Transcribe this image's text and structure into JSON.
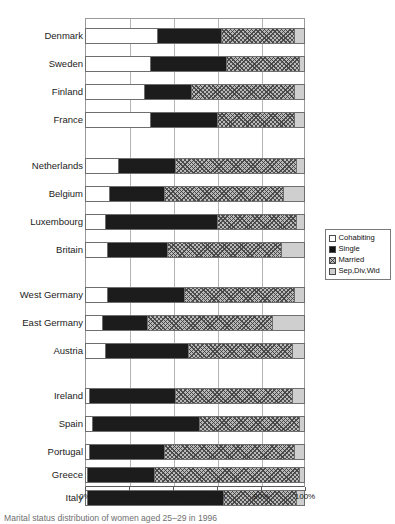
{
  "chart_data": {
    "type": "bar",
    "orientation": "horizontal",
    "stacked": true,
    "normalized": true,
    "title": "",
    "xlabel": "",
    "ylabel": "",
    "xlim": [
      0,
      100
    ],
    "xticks": [
      "0%",
      "20%",
      "40%",
      "60%",
      "80%",
      "100%"
    ],
    "xtick_values": [
      0,
      20,
      40,
      60,
      80,
      100
    ],
    "grid": true,
    "legend_position": "right",
    "categories": [
      "Denmark",
      "Sweden",
      "Finland",
      "France",
      "Netherlands",
      "Belgium",
      "Luxembourg",
      "Britain",
      "West Germany",
      "East Germany",
      "Austria",
      "Ireland",
      "Spain",
      "Portugal",
      "Greece",
      "Italy"
    ],
    "series": [
      {
        "name": "Cohabiting",
        "color": "#ffffff",
        "values": [
          33,
          30,
          27,
          30,
          15,
          11,
          9,
          10,
          10,
          8,
          9,
          2,
          3,
          2,
          1,
          1
        ]
      },
      {
        "name": "Single",
        "color": "#1c1c1c",
        "values": [
          29,
          34,
          21,
          30,
          26,
          25,
          51,
          27,
          35,
          20,
          38,
          39,
          49,
          34,
          30,
          62
        ]
      },
      {
        "name": "Married",
        "color": "#b9b9b9",
        "values": [
          34,
          34,
          48,
          36,
          56,
          55,
          37,
          53,
          51,
          58,
          48,
          54,
          46,
          60,
          67,
          34
        ]
      },
      {
        "name": "Sep,Div,Wid",
        "color": "#cfcfcf",
        "values": [
          4,
          2,
          4,
          4,
          3,
          9,
          3,
          10,
          4,
          14,
          5,
          5,
          2,
          4,
          2,
          3
        ]
      }
    ],
    "groups": [
      {
        "name": "nordic-france",
        "members": [
          "Denmark",
          "Sweden",
          "Finland",
          "France"
        ]
      },
      {
        "name": "benelux-britain",
        "members": [
          "Netherlands",
          "Belgium",
          "Luxembourg",
          "Britain"
        ]
      },
      {
        "name": "germanic",
        "members": [
          "West Germany",
          "East Germany",
          "Austria"
        ]
      },
      {
        "name": "southern",
        "members": [
          "Ireland",
          "Spain",
          "Portugal",
          "Greece",
          "Italy"
        ]
      }
    ]
  },
  "legend": {
    "items": [
      {
        "label": "Cohabiting",
        "swatch": "cohabiting"
      },
      {
        "label": "Single",
        "swatch": "single"
      },
      {
        "label": "Married",
        "swatch": "married"
      },
      {
        "label": "Sep,Div,Wid",
        "swatch": "sep"
      }
    ]
  },
  "caption": {
    "text": "Marital status distribution of women aged 25–29 in 1996"
  },
  "rows": [
    {
      "label": "Denmark",
      "top": 10,
      "values": [
        33,
        29,
        34,
        4
      ]
    },
    {
      "label": "Sweden",
      "top": 38,
      "values": [
        30,
        34,
        34,
        2
      ]
    },
    {
      "label": "Finland",
      "top": 66,
      "values": [
        27,
        21,
        48,
        4
      ]
    },
    {
      "label": "France",
      "top": 94,
      "values": [
        30,
        30,
        36,
        4
      ]
    },
    {
      "label": "Netherlands",
      "top": 140,
      "values": [
        15,
        26,
        56,
        3
      ]
    },
    {
      "label": "Belgium",
      "top": 168,
      "values": [
        11,
        25,
        55,
        9
      ]
    },
    {
      "label": "Luxembourg",
      "top": 196,
      "values": [
        9,
        51,
        37,
        3
      ]
    },
    {
      "label": "Britain",
      "top": 224,
      "values": [
        10,
        27,
        53,
        10
      ]
    },
    {
      "label": "West Germany",
      "top": 269,
      "values": [
        10,
        35,
        51,
        4
      ]
    },
    {
      "label": "East Germany",
      "top": 297,
      "values": [
        8,
        20,
        58,
        14
      ]
    },
    {
      "label": "Austria",
      "top": 325,
      "values": [
        9,
        38,
        48,
        5
      ]
    },
    {
      "label": "Ireland",
      "top": 370,
      "values": [
        2,
        39,
        54,
        5
      ]
    },
    {
      "label": "Spain",
      "top": 398,
      "values": [
        3,
        49,
        46,
        2
      ]
    },
    {
      "label": "Portugal",
      "top": 426,
      "values": [
        2,
        34,
        60,
        4
      ]
    },
    {
      "label": "Greece",
      "top": 449,
      "values": [
        1,
        30,
        67,
        2
      ]
    },
    {
      "label": "Italy",
      "top": 472,
      "values": [
        1,
        62,
        34,
        3
      ]
    }
  ]
}
